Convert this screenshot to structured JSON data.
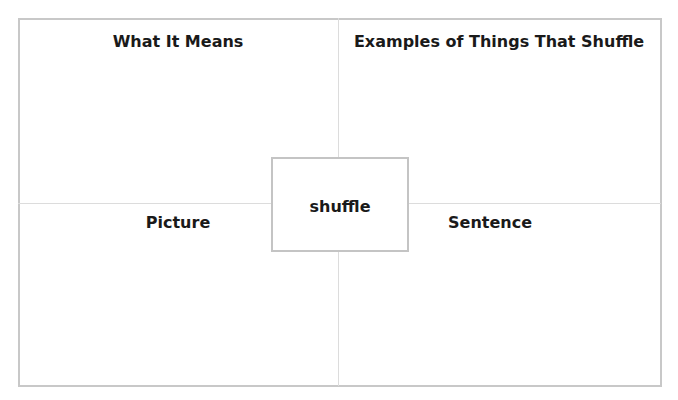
{
  "organizer": {
    "center_word": "shuffle",
    "quadrants": [
      {
        "position": "top-left",
        "label": "What It Means"
      },
      {
        "position": "top-right",
        "label": "Examples of Things That Shuffle"
      },
      {
        "position": "bottom-left",
        "label": "Picture"
      },
      {
        "position": "bottom-right",
        "label": "Sentence"
      }
    ],
    "colors": {
      "border": "#c8c8c8",
      "divider": "#dcdcdc",
      "text": "#1a1a1a"
    }
  }
}
